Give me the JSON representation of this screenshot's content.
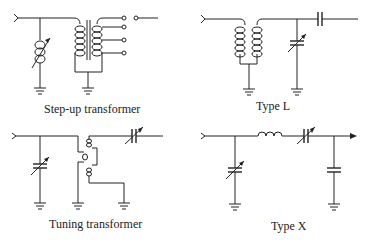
{
  "diagrams": [
    {
      "id": "step-up",
      "label": "Step-up transformer"
    },
    {
      "id": "type-l",
      "label": "Type L"
    },
    {
      "id": "tuning",
      "label": "Tuning transformer"
    },
    {
      "id": "type-x",
      "label": "Type X"
    }
  ],
  "colors": {
    "line": "#222222",
    "background": "#ffffff"
  }
}
